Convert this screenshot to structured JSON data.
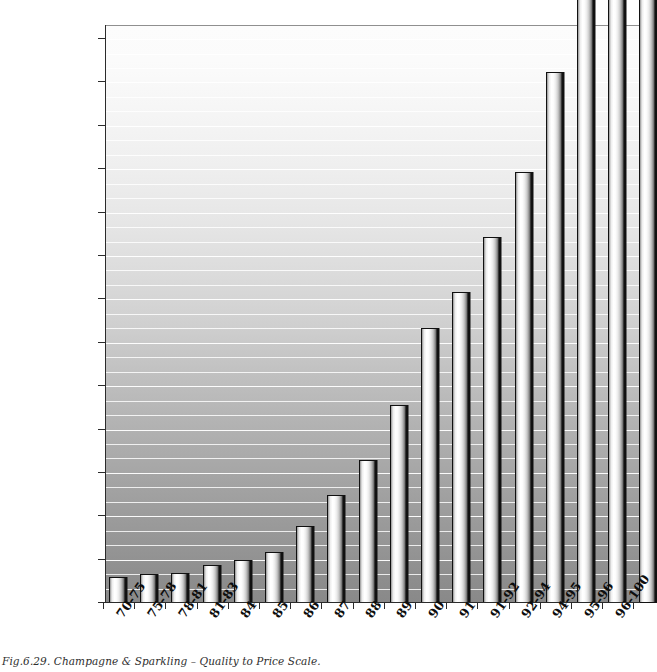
{
  "caption": "Fig.6.29. Champagne & Sparkling – Quality to Price Scale.",
  "chart_data": {
    "type": "bar",
    "title": "Champagne & Sparkling – Quality to Price Scale",
    "xlabel": "",
    "ylabel": "",
    "currency_suffix": "kr",
    "decimal_separator": ",",
    "ylim": [
      0,
      1010
    ],
    "ytick_step": 75,
    "grid": true,
    "grid_orientation": "horizontal",
    "minor_grid_step": 25,
    "legend": "none",
    "note": "The three right-most bars exceed the plotted axis maximum and are clipped by the top edge of the figure.",
    "ytick_labels": [
      "0,00 kr",
      "75,00 kr",
      "150,00 kr",
      "225,00 kr",
      "300,00 kr",
      "375,00 kr",
      "450,00 kr",
      "525,00 kr",
      "600,00 kr",
      "675,00 kr",
      "750,00 kr",
      "825,00 kr",
      "900,00 kr",
      "975,00 kr"
    ],
    "ytick_values": [
      0,
      75,
      150,
      225,
      300,
      375,
      450,
      525,
      600,
      675,
      750,
      825,
      900,
      975
    ],
    "categories": [
      "70-75",
      "75-78",
      "78-81",
      "81-83",
      "84",
      "85",
      "86",
      "87",
      "88",
      "89",
      "90",
      "91",
      "91-92",
      "92-94",
      "94-95",
      "95-96",
      "96-100"
    ],
    "values": [
      45,
      50,
      52,
      65,
      75,
      88,
      133,
      187,
      248,
      343,
      475,
      537,
      632,
      745,
      918,
      1080,
      1120
    ],
    "clipped": [
      false,
      false,
      false,
      false,
      false,
      false,
      false,
      false,
      false,
      false,
      false,
      false,
      false,
      false,
      false,
      true,
      true
    ],
    "extra_partial_bar": {
      "label": "",
      "value": 1120,
      "clipped": true
    },
    "colors": {
      "bar_fill_light": "#ffffff",
      "bar_fill_dark": "#161616",
      "bar_outline": "#111111",
      "plot_bg_top": "#fcfcfc",
      "plot_bg_bottom": "#898989",
      "gridline": "#ffffff",
      "axis": "#2b2b2b",
      "text": "#0d0d0d",
      "caption_text": "#2e2e2e"
    }
  }
}
